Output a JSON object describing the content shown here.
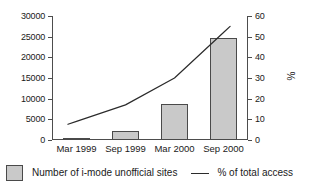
{
  "chart_data": {
    "type": "bar",
    "title": "",
    "xlabel": "",
    "ylabel": "",
    "y2label": "%",
    "grid": false,
    "legend_position": "bottom",
    "categories": [
      "Mar 1999",
      "Sep 1999",
      "Mar 2000",
      "Sep 2000"
    ],
    "ylim": [
      0,
      30000
    ],
    "yticks": [
      0,
      5000,
      10000,
      15000,
      20000,
      25000,
      30000
    ],
    "ytick_labels": [
      "0",
      "5000",
      "10000",
      "15000",
      "20000",
      "25000",
      "30000"
    ],
    "y2lim": [
      0,
      60
    ],
    "y2ticks": [
      0,
      10,
      20,
      30,
      40,
      50,
      60
    ],
    "y2tick_labels": [
      "0",
      "10",
      "20",
      "30",
      "40",
      "50",
      "60"
    ],
    "series": [
      {
        "name": "Number of i-mode unofficial sites",
        "type": "bar",
        "axis": "left",
        "color": "#c9c9c9",
        "edge_color": "#4a4a4a",
        "values": [
          500,
          2300,
          8600,
          24800
        ]
      },
      {
        "name": "% of total access",
        "type": "line",
        "axis": "right",
        "color": "#2b2b2b",
        "values": [
          9,
          17,
          30,
          52
        ]
      }
    ]
  },
  "legend": {
    "bar_label": "Number of i-mode unofficial sites",
    "line_label": "% of total access"
  },
  "axes": {
    "y2_title": "%"
  }
}
